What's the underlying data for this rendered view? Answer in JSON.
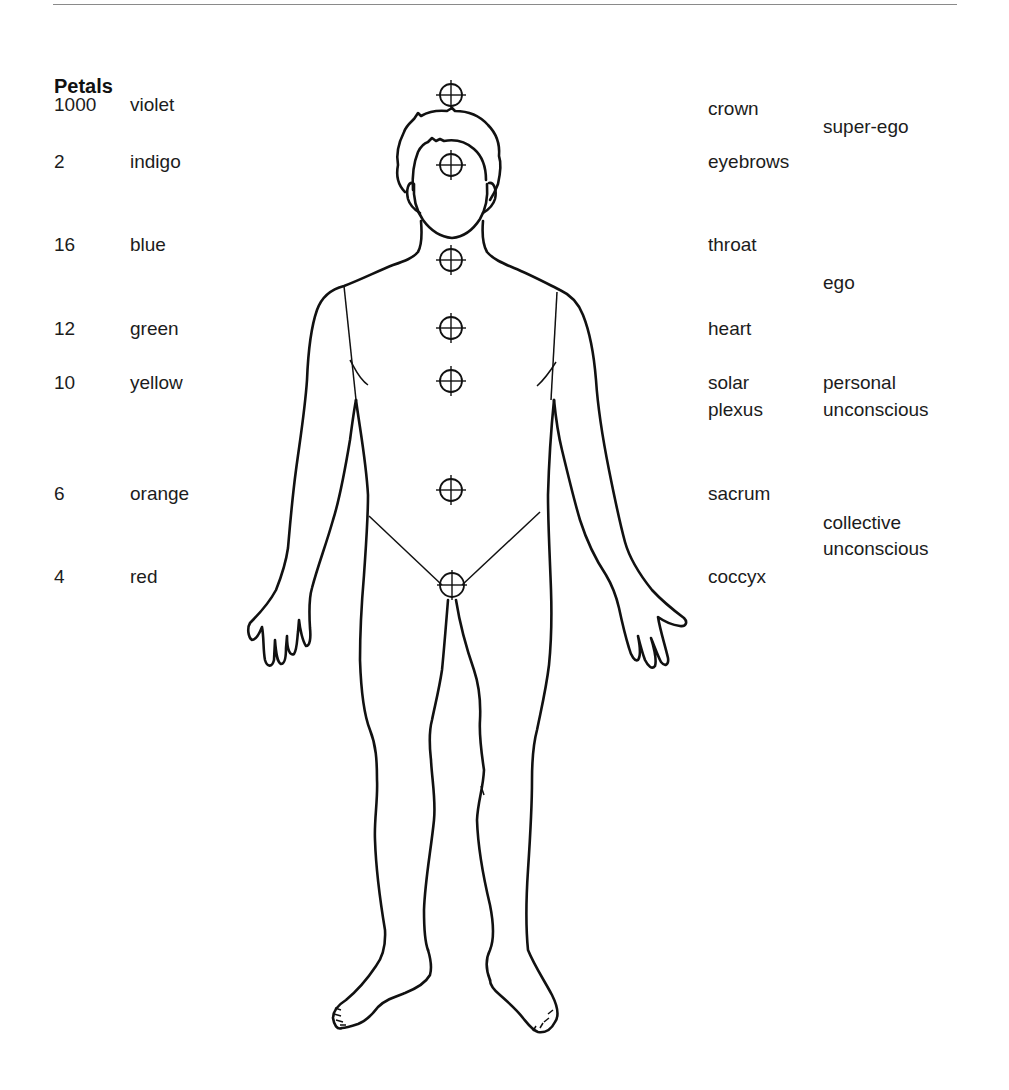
{
  "page": {
    "rule_color": "#8a8a8a",
    "heading": "Petals"
  },
  "left_column": {
    "rows": [
      {
        "petals": "1000",
        "color": "violet"
      },
      {
        "petals": "2",
        "color": "indigo"
      },
      {
        "petals": "16",
        "color": "blue"
      },
      {
        "petals": "12",
        "color": "green"
      },
      {
        "petals": "10",
        "color": "yellow"
      },
      {
        "petals": "6",
        "color": "orange"
      },
      {
        "petals": "4",
        "color": "red"
      }
    ]
  },
  "right_column": {
    "body_parts": [
      {
        "line1": "crown"
      },
      {
        "line1": "eyebrows"
      },
      {
        "line1": "throat"
      },
      {
        "line1": "heart"
      },
      {
        "line1": "solar",
        "line2": "plexus"
      },
      {
        "line1": "sacrum"
      },
      {
        "line1": "coccyx"
      }
    ],
    "psyche_levels": [
      {
        "line1": "super-ego"
      },
      {
        "line1": "ego"
      },
      {
        "line1": "personal",
        "line2": "unconscious"
      },
      {
        "line1": "collective",
        "line2": "unconscious"
      }
    ]
  },
  "figure": {
    "marker_icon": "crosshair-circle",
    "markers": [
      {
        "name": "crown",
        "x": 451,
        "y": 95
      },
      {
        "name": "eyebrows",
        "x": 451,
        "y": 165
      },
      {
        "name": "throat",
        "x": 451,
        "y": 260
      },
      {
        "name": "heart",
        "x": 451,
        "y": 328
      },
      {
        "name": "solar-plexus",
        "x": 451,
        "y": 381
      },
      {
        "name": "sacrum",
        "x": 451,
        "y": 490
      },
      {
        "name": "coccyx",
        "x": 451,
        "y": 585
      }
    ]
  }
}
